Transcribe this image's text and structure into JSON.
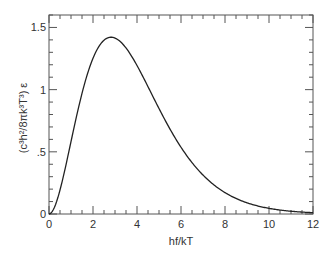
{
  "chart_data": {
    "type": "line",
    "title": "",
    "xlabel": "hf/kT",
    "ylabel": "(c³h²/8πk³T³) ε",
    "xlim": [
      0,
      12
    ],
    "ylim": [
      0,
      1.6
    ],
    "grid": false,
    "legend": null,
    "x_ticks": [
      0,
      2,
      4,
      6,
      8,
      10,
      12
    ],
    "x_tick_labels": [
      "0",
      "2",
      "4",
      "6",
      "8",
      "10",
      "12"
    ],
    "x_minor_step": 0.5,
    "y_ticks": [
      0,
      0.5,
      1,
      1.5
    ],
    "y_tick_labels": [
      "0",
      ".5",
      "1",
      "1.5"
    ],
    "y_minor_step": 0.1,
    "ticks_on_all_sides": true,
    "line_color": "#222222",
    "series": [
      {
        "name": "Planck spectrum",
        "x": [
          0,
          0.25,
          0.5,
          0.75,
          1,
          1.25,
          1.5,
          1.75,
          2,
          2.25,
          2.5,
          2.75,
          2.82,
          3,
          3.25,
          3.5,
          3.75,
          4,
          4.5,
          5,
          5.5,
          6,
          6.5,
          7,
          7.5,
          8,
          8.5,
          9,
          9.5,
          10,
          10.5,
          11,
          11.5,
          12
        ],
        "y": [
          0,
          0.055,
          0.193,
          0.378,
          0.582,
          0.783,
          0.967,
          1.122,
          1.245,
          1.334,
          1.389,
          1.416,
          1.421,
          1.414,
          1.389,
          1.346,
          1.29,
          1.194,
          1.008,
          0.851,
          0.678,
          0.537,
          0.414,
          0.313,
          0.233,
          0.172,
          0.125,
          0.09,
          0.064,
          0.045,
          0.032,
          0.022,
          0.015,
          0.011
        ]
      }
    ],
    "peak": {
      "x": 2.82,
      "y": 1.42
    }
  }
}
